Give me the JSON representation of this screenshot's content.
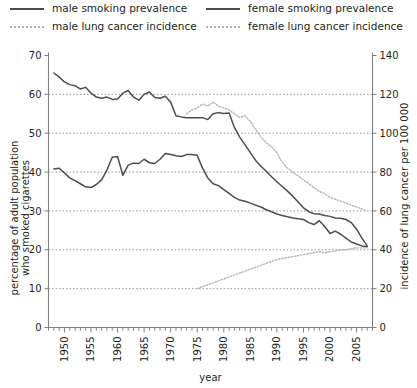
{
  "legend": {
    "items": [
      {
        "label": "male smoking prevalence",
        "style": "solid",
        "name": "legend-male-smoking"
      },
      {
        "label": "male lung cancer incidence",
        "style": "dotted",
        "name": "legend-male-lung-cancer"
      },
      {
        "label": "female smoking prevalence",
        "style": "solid",
        "name": "legend-female-smoking"
      },
      {
        "label": "female lung cancer incidence",
        "style": "dotted",
        "name": "legend-female-lung-cancer"
      }
    ]
  },
  "colors": {
    "smoking_line": "#4d4d4d",
    "cancer_line": "#b8b8b8",
    "axis": "#808080",
    "grid": "#6e6e6e",
    "text": "#231f20"
  },
  "chart_data": {
    "type": "line",
    "title": "",
    "xlabel": "year",
    "ylabel": "percentage of adult population who smoked cigarettes",
    "y2label": "incidence of lung cancer per 100 000",
    "xlim": [
      1947,
      2008
    ],
    "ylim": [
      0,
      70
    ],
    "y2lim": [
      0,
      140
    ],
    "yticks": [
      0,
      10,
      20,
      30,
      40,
      50,
      60,
      70
    ],
    "y2ticks": [
      0,
      20,
      40,
      60,
      80,
      100,
      120,
      140
    ],
    "xticks": [
      1950,
      1955,
      1960,
      1965,
      1970,
      1975,
      1980,
      1985,
      1990,
      1995,
      2000,
      2005
    ],
    "xminor_step": 1,
    "grid": "horizontal dotted",
    "legend_position": "above plot, two columns",
    "series": [
      {
        "name": "male smoking prevalence",
        "axis": "left",
        "style": "solid",
        "x": [
          1948,
          1949,
          1950,
          1951,
          1952,
          1953,
          1954,
          1955,
          1956,
          1957,
          1958,
          1959,
          1960,
          1961,
          1962,
          1963,
          1964,
          1965,
          1966,
          1967,
          1968,
          1969,
          1970,
          1971,
          1972,
          1973,
          1974,
          1975,
          1976,
          1977,
          1978,
          1979,
          1980,
          1981,
          1982,
          1983,
          1984,
          1985,
          1986,
          1987,
          1988,
          1989,
          1990,
          1991,
          1992,
          1993,
          1994,
          1995,
          1996,
          1997,
          1998,
          1999,
          2000,
          2001,
          2002,
          2003,
          2004,
          2005,
          2006,
          2007
        ],
        "values": [
          65.5,
          64.5,
          63.2,
          62.5,
          62.2,
          61.4,
          61.8,
          60.3,
          59.3,
          59.0,
          59.3,
          58.7,
          58.8,
          60.3,
          61.0,
          59.3,
          58.5,
          60.0,
          60.6,
          59.2,
          59.0,
          59.5,
          58.0,
          54.5,
          54.2,
          54.0,
          54.0,
          54.0,
          54.0,
          53.5,
          55.0,
          55.3,
          55.1,
          55.2,
          51.5,
          49.0,
          47.0,
          45.0,
          43.0,
          41.5,
          40.2,
          38.8,
          37.5,
          36.3,
          35.1,
          33.8,
          32.3,
          30.8,
          29.8,
          29.3,
          29.2,
          28.8,
          28.6,
          28.2,
          28.1,
          27.8,
          27.0,
          25.3,
          23.0,
          21.0
        ]
      },
      {
        "name": "female smoking prevalence",
        "axis": "left",
        "style": "solid",
        "x": [
          1948,
          1949,
          1950,
          1951,
          1952,
          1953,
          1954,
          1955,
          1956,
          1957,
          1958,
          1959,
          1960,
          1961,
          1962,
          1963,
          1964,
          1965,
          1966,
          1967,
          1968,
          1969,
          1970,
          1971,
          1972,
          1973,
          1974,
          1975,
          1976,
          1977,
          1978,
          1979,
          1980,
          1981,
          1982,
          1983,
          1984,
          1985,
          1986,
          1987,
          1988,
          1989,
          1990,
          1991,
          1992,
          1993,
          1994,
          1995,
          1996,
          1997,
          1998,
          1999,
          2000,
          2001,
          2002,
          2003,
          2004,
          2005,
          2006,
          2007
        ],
        "values": [
          40.8,
          41.0,
          39.8,
          38.5,
          37.8,
          37.0,
          36.2,
          36.0,
          36.8,
          38.0,
          40.5,
          43.8,
          44.0,
          39.2,
          41.8,
          42.3,
          42.2,
          43.3,
          42.4,
          42.2,
          43.3,
          44.8,
          44.5,
          44.2,
          44.0,
          44.5,
          44.5,
          44.3,
          41.0,
          38.5,
          37.0,
          36.5,
          35.5,
          34.5,
          33.5,
          32.8,
          32.5,
          32.0,
          31.5,
          31.0,
          30.3,
          29.8,
          29.2,
          28.8,
          28.5,
          28.2,
          28.0,
          27.8,
          27.0,
          26.5,
          27.5,
          26.0,
          24.2,
          24.8,
          24.0,
          23.0,
          22.0,
          21.5,
          21.0,
          20.8
        ]
      },
      {
        "name": "male lung cancer incidence",
        "axis": "right",
        "style": "dotted",
        "x": [
          1973,
          1974,
          1975,
          1976,
          1977,
          1978,
          1979,
          1980,
          1981,
          1982,
          1983,
          1984,
          1985,
          1986,
          1987,
          1988,
          1989,
          1990,
          1991,
          1992,
          1993,
          1994,
          1995,
          1996,
          1997,
          1998,
          1999,
          2000,
          2001,
          2002,
          2003,
          2004,
          2005,
          2006,
          2007
        ],
        "values": [
          110,
          112,
          113,
          115,
          114,
          116,
          114,
          113,
          112,
          110,
          108,
          109,
          106,
          102,
          98,
          95,
          93,
          90,
          85,
          82,
          80,
          78,
          76,
          74,
          72,
          70,
          69,
          67,
          66,
          65,
          64,
          63,
          62,
          61,
          60
        ]
      },
      {
        "name": "female lung cancer incidence",
        "axis": "right",
        "style": "dotted",
        "x": [
          1975,
          1976,
          1977,
          1978,
          1979,
          1980,
          1981,
          1982,
          1983,
          1984,
          1985,
          1986,
          1987,
          1988,
          1989,
          1990,
          1991,
          1992,
          1993,
          1994,
          1995,
          1996,
          1997,
          1998,
          1999,
          2000,
          2001,
          2002,
          2003,
          2004,
          2005,
          2006,
          2007
        ],
        "values": [
          20,
          21,
          22,
          23,
          24,
          25,
          26,
          27,
          28,
          29,
          30,
          31,
          32,
          33,
          34,
          35,
          35.5,
          36,
          36.5,
          37,
          37.5,
          38,
          38.5,
          39,
          38.5,
          39,
          39.5,
          40,
          40,
          40.5,
          41,
          41,
          41
        ]
      }
    ]
  }
}
